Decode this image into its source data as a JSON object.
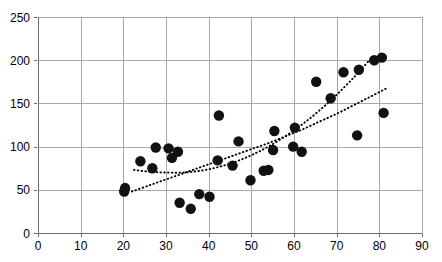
{
  "chart_data": {
    "type": "scatter",
    "title": "",
    "subtitle": "",
    "xlabel": "",
    "ylabel": "",
    "xlim": [
      0,
      90
    ],
    "ylim": [
      0,
      250
    ],
    "xticks": [
      0,
      10,
      20,
      30,
      40,
      50,
      60,
      70,
      80,
      90
    ],
    "yticks": [
      0,
      50,
      100,
      150,
      200,
      250
    ],
    "xtick_labels": [
      "0",
      "10",
      "20",
      "30",
      "40",
      "50",
      "60",
      "70",
      "80",
      "90"
    ],
    "ytick_labels": [
      "0",
      "50",
      "100",
      "150",
      "200",
      "250"
    ],
    "grid": true,
    "legend": null,
    "legend_position": "none",
    "marker": "filled-circle",
    "marker_color": "#111111",
    "marker_size": 6.2,
    "points": [
      {
        "x": 20.2,
        "y": 48
      },
      {
        "x": 20.4,
        "y": 52
      },
      {
        "x": 24.0,
        "y": 83
      },
      {
        "x": 26.8,
        "y": 75
      },
      {
        "x": 27.6,
        "y": 99
      },
      {
        "x": 30.6,
        "y": 98
      },
      {
        "x": 31.4,
        "y": 87
      },
      {
        "x": 32.8,
        "y": 94
      },
      {
        "x": 33.2,
        "y": 35
      },
      {
        "x": 35.8,
        "y": 28
      },
      {
        "x": 37.8,
        "y": 45
      },
      {
        "x": 40.2,
        "y": 42
      },
      {
        "x": 42.1,
        "y": 84
      },
      {
        "x": 42.4,
        "y": 136
      },
      {
        "x": 45.6,
        "y": 78
      },
      {
        "x": 47.0,
        "y": 106
      },
      {
        "x": 49.8,
        "y": 61
      },
      {
        "x": 52.9,
        "y": 72
      },
      {
        "x": 54.0,
        "y": 73
      },
      {
        "x": 55.1,
        "y": 96
      },
      {
        "x": 55.4,
        "y": 118
      },
      {
        "x": 59.8,
        "y": 100
      },
      {
        "x": 60.2,
        "y": 122
      },
      {
        "x": 61.8,
        "y": 94
      },
      {
        "x": 65.2,
        "y": 175
      },
      {
        "x": 68.6,
        "y": 156
      },
      {
        "x": 71.6,
        "y": 186
      },
      {
        "x": 74.8,
        "y": 113
      },
      {
        "x": 75.2,
        "y": 189
      },
      {
        "x": 78.8,
        "y": 200
      },
      {
        "x": 80.6,
        "y": 203
      },
      {
        "x": 81.0,
        "y": 139
      }
    ],
    "curves": [
      {
        "name": "upper-dotted-curve",
        "style": "dotted",
        "color": "#000000",
        "points": [
          {
            "x": 22.5,
            "y": 73
          },
          {
            "x": 26.0,
            "y": 71
          },
          {
            "x": 30.0,
            "y": 70
          },
          {
            "x": 34.0,
            "y": 70
          },
          {
            "x": 38.0,
            "y": 72
          },
          {
            "x": 42.0,
            "y": 76
          },
          {
            "x": 46.0,
            "y": 82
          },
          {
            "x": 50.0,
            "y": 90
          },
          {
            "x": 54.0,
            "y": 100
          },
          {
            "x": 58.0,
            "y": 112
          },
          {
            "x": 62.0,
            "y": 126
          },
          {
            "x": 66.0,
            "y": 142
          },
          {
            "x": 70.0,
            "y": 160
          },
          {
            "x": 74.0,
            "y": 180
          },
          {
            "x": 77.5,
            "y": 199
          }
        ]
      },
      {
        "name": "lower-dotted-curve",
        "style": "dotted",
        "color": "#000000",
        "points": [
          {
            "x": 22.0,
            "y": 48
          },
          {
            "x": 26.0,
            "y": 55
          },
          {
            "x": 30.0,
            "y": 62
          },
          {
            "x": 34.0,
            "y": 69
          },
          {
            "x": 38.0,
            "y": 76
          },
          {
            "x": 42.0,
            "y": 83
          },
          {
            "x": 46.0,
            "y": 90
          },
          {
            "x": 50.0,
            "y": 97
          },
          {
            "x": 54.0,
            "y": 104
          },
          {
            "x": 58.0,
            "y": 112
          },
          {
            "x": 62.0,
            "y": 120
          },
          {
            "x": 66.0,
            "y": 129
          },
          {
            "x": 70.0,
            "y": 138
          },
          {
            "x": 74.0,
            "y": 148
          },
          {
            "x": 78.0,
            "y": 158
          },
          {
            "x": 81.5,
            "y": 167
          }
        ]
      }
    ]
  },
  "plot_geometry": {
    "left": 38,
    "right": 422,
    "top": 17,
    "bottom": 233
  }
}
